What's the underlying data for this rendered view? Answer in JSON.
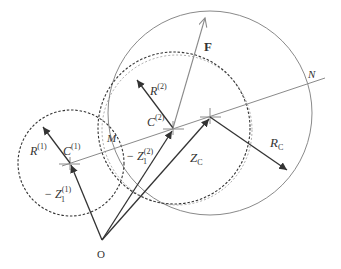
{
  "diagram": {
    "labels": {
      "origin": "O",
      "force": "F",
      "point_n": "N",
      "point_m": "M",
      "r1_main": "R",
      "r1_sup": "(1)",
      "c1_main": "C",
      "c1_sup": "(1)",
      "z1_main": "− Z",
      "z1_sup": "(1)",
      "z1_sub": "1",
      "r2_main": "R",
      "r2_sup": "(2)",
      "c2_main": "C",
      "c2_sup": "(2)",
      "z2_main": "− Z",
      "z2_sup": "(2)",
      "z2_sub": "1",
      "zc_main": "Z",
      "zc_sub": "C",
      "rc_main": "R",
      "rc_sub": "C"
    },
    "colors": {
      "dark_stroke": "#333333",
      "light_stroke": "#8a8a8a",
      "background": "#ffffff"
    }
  }
}
